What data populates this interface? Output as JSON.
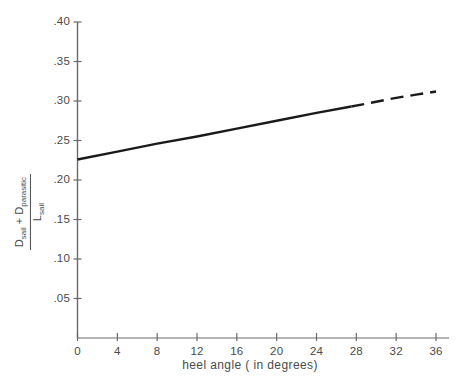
{
  "chart_data": {
    "type": "line",
    "title": "",
    "xlabel": "heel angle  ( in degrees)",
    "ylabel_numerator_left": "D",
    "ylabel_numerator_left_sub": "sail",
    "ylabel_numerator_plus": "+",
    "ylabel_numerator_right": "D",
    "ylabel_numerator_right_sub": "parasitic",
    "ylabel_denominator": "L",
    "ylabel_denominator_sub": "sail",
    "xlim": [
      0,
      38
    ],
    "ylim": [
      0,
      0.4
    ],
    "xticks": [
      0,
      4,
      8,
      12,
      16,
      20,
      24,
      28,
      32,
      36
    ],
    "xticklabels": [
      "0",
      "4",
      "8",
      "12",
      "16",
      "20",
      "24",
      "28",
      "32",
      "36"
    ],
    "yticks": [
      0.05,
      0.1,
      0.15,
      0.2,
      0.25,
      0.3,
      0.35,
      0.4
    ],
    "yticklabels": [
      ".05",
      ".10",
      ".15",
      ".20",
      ".25",
      ".30",
      ".35",
      ".40"
    ],
    "grid": false,
    "legend": "none",
    "series": [
      {
        "name": "drag ratio (measured)",
        "style": "solid",
        "color": "#1a1a1a",
        "x": [
          0,
          4,
          8,
          12,
          16,
          20,
          24,
          27.5
        ],
        "values": [
          0.226,
          0.236,
          0.246,
          0.255,
          0.265,
          0.275,
          0.285,
          0.293
        ]
      },
      {
        "name": "drag ratio (extrapolated)",
        "style": "dashed",
        "color": "#1a1a1a",
        "x": [
          27.5,
          30,
          32,
          34,
          36
        ],
        "values": [
          0.293,
          0.299,
          0.304,
          0.308,
          0.312
        ]
      }
    ],
    "axis_color": "#6b6b6b",
    "line_color": "#1a1a1a",
    "background": "#ffffff"
  },
  "axes": {
    "x_title": "heel angle  ( in degrees)"
  }
}
